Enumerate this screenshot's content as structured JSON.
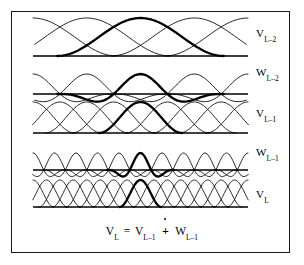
{
  "figure": {
    "background_color": "#ffffff",
    "frame_color": "#1a1a1a",
    "curve_color": "#000000",
    "highlight_color": "#000000",
    "baseline_color": "#000000"
  },
  "bands": [
    {
      "id": "v-l-minus-2",
      "label_main": "V",
      "label_sub": "L–2",
      "kind": "scaling",
      "basis_count": 5,
      "highlight_index": 2,
      "baseline_y": 56,
      "top_y": 18,
      "amplitude": 38,
      "label_x": 256,
      "label_y": 27
    },
    {
      "id": "w-l-minus-2",
      "label_main": "W",
      "label_sub": "L–2",
      "kind": "wavelet",
      "basis_count": 5,
      "highlight_index": 2,
      "baseline_y": 94,
      "top_y": 60,
      "amplitude": 20,
      "label_x": 256,
      "label_y": 66
    },
    {
      "id": "v-l-minus-1",
      "label_main": "V",
      "label_sub": "L–1",
      "kind": "scaling",
      "basis_count": 9,
      "highlight_index": 4,
      "baseline_y": 133,
      "top_y": 102,
      "amplitude": 31,
      "label_x": 256,
      "label_y": 107
    },
    {
      "id": "w-l-minus-1",
      "label_main": "W",
      "label_sub": "L–1",
      "kind": "wavelet",
      "basis_count": 11,
      "highlight_index": 5,
      "baseline_y": 170,
      "top_y": 142,
      "amplitude": 17,
      "label_x": 256,
      "label_y": 146
    },
    {
      "id": "v-l",
      "label_main": "V",
      "label_sub": "L",
      "kind": "scaling",
      "basis_count": 17,
      "highlight_index": 8,
      "baseline_y": 207,
      "top_y": 180,
      "amplitude": 27,
      "label_x": 256,
      "label_y": 188
    }
  ],
  "plot_extent": {
    "x_left": 33,
    "x_right": 248
  },
  "equation": {
    "lhs_main": "V",
    "lhs_sub": "L",
    "equals": "=",
    "rhs1_main": "V",
    "rhs1_sub": "L–1",
    "operator": "+",
    "operator_name": "dotted-direct-sum",
    "rhs2_main": "W",
    "rhs2_sub": "L–1",
    "plain_text": "V_L = V_{L-1} ∔ W_{L-1}"
  }
}
